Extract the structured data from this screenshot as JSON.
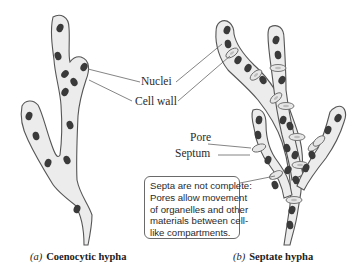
{
  "diagram": {
    "labels": {
      "nuclei": "Nuclei",
      "cell_wall": "Cell wall",
      "pore": "Pore",
      "septum": "Septum"
    },
    "callout": {
      "lines": [
        "Septa are not complete:",
        "Pores allow movement",
        "of organelles and other",
        "materials between cell-",
        "like compartments."
      ]
    },
    "captions": {
      "a": {
        "letter": "(a)",
        "name": "Coenocytic hypha"
      },
      "b": {
        "letter": "(b)",
        "name": "Septate hypha"
      }
    },
    "colors": {
      "hypha_fill": "#ececec",
      "outline": "#555555",
      "nucleus": "#3a3a3a",
      "leader_line": "#666666"
    }
  }
}
